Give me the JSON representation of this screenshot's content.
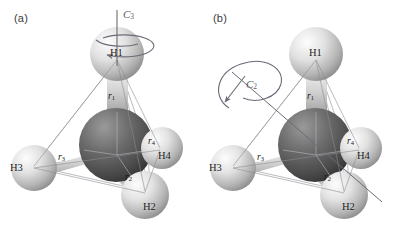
{
  "figure": {
    "background_color": "#ffffff",
    "panel_count": 2
  },
  "panels": [
    {
      "id": "a",
      "label": "(a)",
      "symmetry_axis": {
        "name": "C3",
        "label": "C",
        "subscript": "3",
        "orientation": "vertical",
        "description": "threefold rotation axis through H1 and central carbon",
        "arrow_color": "#6b6b78"
      },
      "atoms": [
        {
          "name": "H1",
          "label": "H1",
          "position": "top"
        },
        {
          "name": "H2",
          "label": "H2",
          "position": "bottom-right-front"
        },
        {
          "name": "H3",
          "label": "H3",
          "position": "left"
        },
        {
          "name": "H4",
          "label": "H4",
          "position": "right"
        }
      ],
      "bonds": [
        {
          "name": "r1",
          "label": "r",
          "subscript": "1",
          "to": "H1"
        },
        {
          "name": "r2",
          "label": "r",
          "subscript": "2",
          "to": "H2"
        },
        {
          "name": "r3",
          "label": "r",
          "subscript": "3",
          "to": "H3"
        },
        {
          "name": "r4",
          "label": "r",
          "subscript": "4",
          "to": "H4"
        }
      ]
    },
    {
      "id": "b",
      "label": "(b)",
      "symmetry_axis": {
        "name": "C2",
        "label": "C",
        "subscript": "2",
        "orientation": "diagonal",
        "description": "twofold rotation axis passing diagonally through the molecule",
        "arrow_color": "#6b6b78"
      },
      "atoms": [
        {
          "name": "H1",
          "label": "H1",
          "position": "top"
        },
        {
          "name": "H2",
          "label": "H2",
          "position": "bottom-right-front"
        },
        {
          "name": "H3",
          "label": "H3",
          "position": "left"
        },
        {
          "name": "H4",
          "label": "H4",
          "position": "right"
        }
      ],
      "bonds": [
        {
          "name": "r1",
          "label": "r",
          "subscript": "1",
          "to": "H1"
        },
        {
          "name": "r2",
          "label": "r",
          "subscript": "2",
          "to": "H2"
        },
        {
          "name": "r3",
          "label": "r",
          "subscript": "3",
          "to": "H3"
        },
        {
          "name": "r4",
          "label": "r",
          "subscript": "4",
          "to": "H4"
        }
      ]
    }
  ],
  "colors": {
    "hydrogen_light": "#e8e8e8",
    "hydrogen_mid": "#bdbdbd",
    "hydrogen_dark": "#8f8f8f",
    "carbon_light": "#8a8a8a",
    "carbon_mid": "#5c5c5c",
    "carbon_dark": "#3a3a3a",
    "bond_light": "#d8d8d8",
    "bond_dark": "#4a4a4a",
    "wireframe": "#9a9aa2",
    "axis": "#6b6b78",
    "text": "#1a1a1a"
  }
}
